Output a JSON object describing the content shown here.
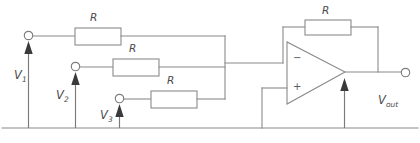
{
  "figure": {
    "type": "circuit-schematic",
    "name": "inverting-summing-amplifier",
    "width": 420,
    "height": 143,
    "background_color": "#ffffff",
    "line_color": "#8a8a8a",
    "label_color": "#4a4a4a",
    "arrow_color": "#3a3a3a"
  },
  "components": {
    "input_resistors": [
      {
        "id": "r-input-1",
        "label": "R",
        "label_x": 93,
        "label_y": 14,
        "x": 75,
        "y": 28,
        "w": 46,
        "h": 17
      },
      {
        "id": "r-input-2",
        "label": "R",
        "label_x": 131,
        "label_y": 45,
        "x": 113,
        "y": 59,
        "w": 46,
        "h": 17
      },
      {
        "id": "r-input-3",
        "label": "R",
        "label_x": 169,
        "label_y": 77,
        "x": 151,
        "y": 91,
        "w": 46,
        "h": 17
      }
    ],
    "feedback_resistor": {
      "id": "r-feedback",
      "label": "R",
      "label_x": 324,
      "label_y": 7,
      "x": 305,
      "y": 20,
      "w": 46,
      "h": 15
    },
    "opamp": {
      "id": "opamp",
      "inverting_sign": "−",
      "noninverting_sign": "+",
      "inverting_sign_x": 293,
      "inverting_sign_y": 56,
      "noninverting_sign_x": 293,
      "noninverting_sign_y": 85
    }
  },
  "terminals": [
    {
      "id": "terminal-v1",
      "cx": 28.5,
      "cy": 35.5,
      "r": 4.2
    },
    {
      "id": "terminal-v2",
      "cx": 75.5,
      "cy": 66.5,
      "r": 4.2
    },
    {
      "id": "terminal-v3",
      "cx": 119.5,
      "cy": 98.5,
      "r": 4.2
    },
    {
      "id": "terminal-vout",
      "cx": 405.5,
      "cy": 72.5,
      "r": 4.2
    }
  ],
  "labels": {
    "v1": {
      "text": "V",
      "sub": "1",
      "x": 14,
      "y": 70
    },
    "v2": {
      "text": "V",
      "sub": "2",
      "x": 56,
      "y": 90
    },
    "v3": {
      "text": "V",
      "sub": "3",
      "x": 100,
      "y": 110
    },
    "vout": {
      "text": "V",
      "sub": "out",
      "x": 378,
      "y": 95
    }
  },
  "nodes": {
    "summing_bus_x": 225,
    "ground_line_y": 128,
    "opamp_output_y": 72,
    "feedback_left_x": 283,
    "feedback_right_x": 378,
    "noninverting_drop_x": 262
  }
}
